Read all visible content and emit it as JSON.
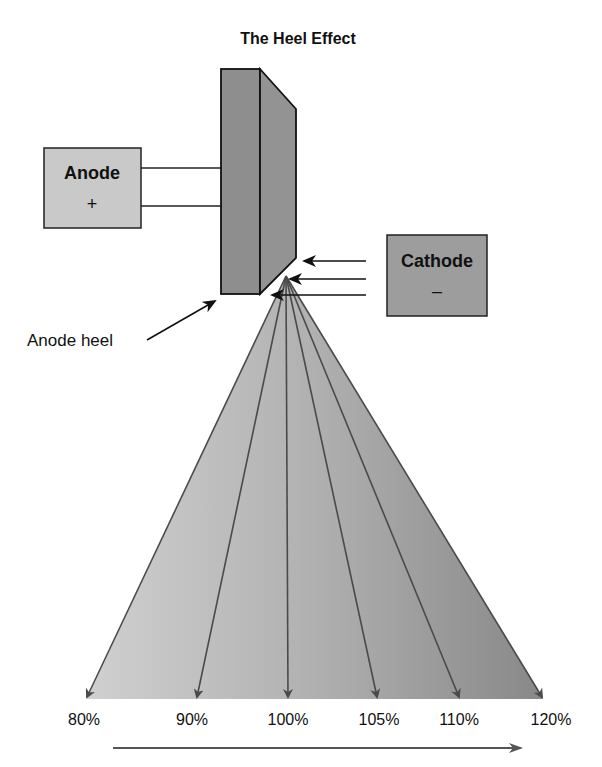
{
  "diagram": {
    "title": "The Heel Effect",
    "anode_box": {
      "label": "Anode",
      "sign": "+",
      "fill": "#c9c9c9"
    },
    "cathode_box": {
      "label": "Cathode",
      "sign": "–",
      "fill": "#9d9d9d"
    },
    "anode_heel_label": "Anode heel",
    "anode_block_fill": "#8e8e8e",
    "beam": {
      "gradient_left": "#cdcdcd",
      "gradient_right": "#8a8a8a",
      "arrow_color": "#4a4a4a"
    },
    "intensity_labels": [
      "80%",
      "90%",
      "100%",
      "105%",
      "110%",
      "120%"
    ],
    "direction_arrow": "increasing intensity toward cathode side"
  }
}
